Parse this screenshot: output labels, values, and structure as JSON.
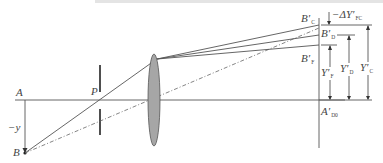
{
  "diagram": {
    "type": "optical-ray-diagram",
    "colors": {
      "line": "#555555",
      "lens_fill": "#a6a6a6",
      "stop": "#222222",
      "background": "#ffffff"
    },
    "labels": {
      "A": "A",
      "B": "B",
      "P": "P",
      "minus_y": "−y",
      "B_C": {
        "main": "B′",
        "sub": "C"
      },
      "B_D": {
        "main": "B′",
        "sub": "D"
      },
      "B_F": {
        "main": "B′",
        "sub": "F"
      },
      "A_D0": {
        "main": "A′",
        "sub": "D0"
      },
      "Y_F": {
        "main": "Y′",
        "sub": "F"
      },
      "Y_D": {
        "main": "Y′",
        "sub": "D"
      },
      "Y_C": {
        "main": "Y′",
        "sub": "C"
      },
      "delta_Y_FC": {
        "main": "−ΔY′",
        "sub": "FC"
      }
    },
    "elements": [
      {
        "name": "optical-axis",
        "from": [
          15,
          100
        ],
        "to": [
          345,
          100
        ]
      },
      {
        "name": "object-height-arrow",
        "from": [
          25,
          100
        ],
        "to": [
          25,
          153
        ]
      },
      {
        "name": "aperture-stop",
        "x": 100,
        "gap_center": 100
      },
      {
        "name": "lens",
        "cx": 154,
        "cy": 100,
        "rx": 6,
        "ry": 46
      },
      {
        "name": "image-plane",
        "x": 319,
        "y1": 18,
        "y2": 148
      },
      {
        "name": "image-points",
        "B_C_y": 24,
        "B_D_y": 34,
        "B_F_y": 45
      }
    ]
  }
}
